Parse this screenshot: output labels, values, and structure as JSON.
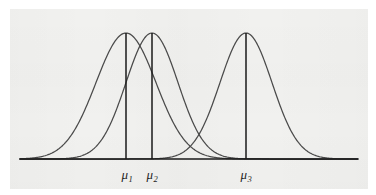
{
  "figure": {
    "background_color": "#f1f1ef",
    "page_color": "#ffffff",
    "ink_color": "#3a3a3a",
    "axis_color": "#1a1a1a",
    "label_color": "#1d1d1d"
  },
  "chart_data": {
    "type": "line",
    "title": "",
    "subtitle": "",
    "xlabel": "",
    "ylabel": "",
    "grid": false,
    "legend_position": "none",
    "axis": {
      "x_start_px": 20,
      "x_end_px": 358,
      "baseline_y_px": 159,
      "ticks": [],
      "tick_labels": []
    },
    "annotations": [
      {
        "name": "mu-1-label",
        "text": "μ",
        "subscript": "1",
        "x_px": 127,
        "y_px": 178
      },
      {
        "name": "mu-2-label",
        "text": "μ",
        "subscript": "2",
        "x_px": 152,
        "y_px": 178
      },
      {
        "name": "mu-3-label",
        "text": "μ",
        "subscript": "3",
        "x_px": 246,
        "y_px": 178
      }
    ],
    "series": [
      {
        "name": "normal-curve-1",
        "label": "μ₁ curve",
        "mean_px": 126,
        "sigma_px": 30,
        "peak_y_px": 33,
        "amplitude_px": 126,
        "mean_label": "μ1",
        "color": "#4a4a4a"
      },
      {
        "name": "normal-curve-2",
        "label": "μ₂ curve",
        "mean_px": 152,
        "sigma_px": 26,
        "peak_y_px": 33,
        "amplitude_px": 126,
        "mean_label": "μ2",
        "color": "#4a4a4a"
      },
      {
        "name": "normal-curve-3",
        "label": "μ₃ curve",
        "mean_px": 246,
        "sigma_px": 26,
        "peak_y_px": 33,
        "amplitude_px": 126,
        "mean_label": "μ3",
        "color": "#4a4a4a"
      }
    ],
    "vertical_lines": [
      {
        "name": "mean-line-1",
        "x_px": 126,
        "y_top_px": 33,
        "y_bottom_px": 159
      },
      {
        "name": "mean-line-2",
        "x_px": 152,
        "y_top_px": 33,
        "y_bottom_px": 159
      },
      {
        "name": "mean-line-3",
        "x_px": 246,
        "y_top_px": 33,
        "y_bottom_px": 159
      }
    ]
  }
}
